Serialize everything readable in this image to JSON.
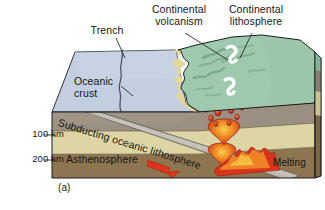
{
  "figure": {
    "panel_label": "(a)"
  },
  "labels": {
    "trench": "Trench",
    "continental_volcanism": "Continental\nvolcanism",
    "continental_lithosphere": "Continental\nlithosphere",
    "oceanic_crust": "Oceanic\ncrust",
    "subducting_oceanic_lithosphere": "Subducting oceanic lithosphere",
    "asthenosphere": "Asthenosphere",
    "melting": "Melting"
  },
  "depth_scale": {
    "ticks": [
      {
        "label": "100 km",
        "value": 100,
        "unit": "km"
      },
      {
        "label": "200 km",
        "value": 200,
        "unit": "km"
      }
    ]
  },
  "colors": {
    "ocean_surface": "#c3cfe0",
    "ocean_surface_shadow": "#b2c0d4",
    "continent_green": "#9ec9ae",
    "continent_green_dark": "#7fb393",
    "coast_yellow": "#e4d898",
    "crust_gray_band": "#9a8f80",
    "crust_gray_band_dark": "#8a7f70",
    "lithosphere_khaki": "#ddd6a4",
    "lithosphere_khaki_dark": "#cbc390",
    "asthenosphere_brown": "#8d7550",
    "asthenosphere_brown_dark": "#7d6644",
    "slab_gray": "#b9b6ae",
    "magma_red": "#d8341c",
    "magma_orange": "#f08a26",
    "magma_yellow": "#f5c242",
    "arrow_red": "#e0341a",
    "outline": "#1c1c1c",
    "text": "#161616"
  },
  "features": {
    "trench_line": "wavy-dark-line-on-ocean-surface",
    "volcano_markers": 2,
    "magma_blobs": 9,
    "subduction_arrow_direction": "down-right",
    "melting_wedge": "orange-red-flame-zone-above-slab"
  }
}
